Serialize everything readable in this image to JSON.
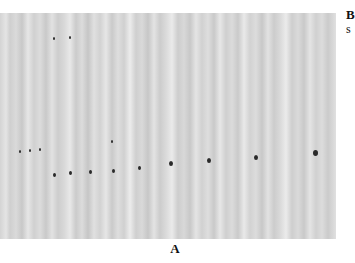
{
  "figure": {
    "panel_label": "A",
    "side_text": {
      "line1": "B",
      "line2": "s"
    },
    "dots": [
      {
        "x": 20,
        "y": 151,
        "size": 2
      },
      {
        "x": 30,
        "y": 150,
        "size": 2
      },
      {
        "x": 40,
        "y": 149,
        "size": 2
      },
      {
        "x": 54,
        "y": 174,
        "size": 3
      },
      {
        "x": 70,
        "y": 172,
        "size": 3
      },
      {
        "x": 90,
        "y": 171,
        "size": 3
      },
      {
        "x": 113,
        "y": 170,
        "size": 3
      },
      {
        "x": 139,
        "y": 167,
        "size": 3
      },
      {
        "x": 171,
        "y": 163,
        "size": 4
      },
      {
        "x": 209,
        "y": 160,
        "size": 4
      },
      {
        "x": 256,
        "y": 157,
        "size": 4
      },
      {
        "x": 315,
        "y": 152,
        "size": 5
      },
      {
        "x": 112,
        "y": 141,
        "size": 2
      },
      {
        "x": 70,
        "y": 37,
        "size": 2
      },
      {
        "x": 54,
        "y": 38,
        "size": 2
      }
    ]
  }
}
